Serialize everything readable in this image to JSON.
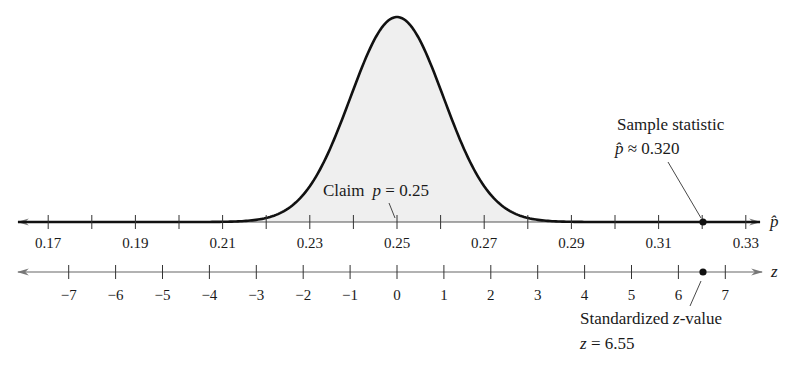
{
  "chart_data": {
    "type": "area",
    "title": "",
    "distribution": "normal",
    "claim": {
      "label": "Claim",
      "symbol": "p",
      "value": "0.25",
      "text": "Claim p = 0.25"
    },
    "sample_statistic": {
      "label": "Sample statistic",
      "symbol": "p̂",
      "relation": "≈",
      "value": "0.320",
      "x": 0.32
    },
    "standardized": {
      "label": "Standardized z-value",
      "symbol": "z",
      "relation": "=",
      "value": "6.55",
      "x": 6.55
    },
    "p_axis": {
      "label": "p̂",
      "ticks": [
        0.17,
        0.18,
        0.19,
        0.2,
        0.21,
        0.22,
        0.23,
        0.24,
        0.25,
        0.26,
        0.27,
        0.28,
        0.29,
        0.3,
        0.31,
        0.32,
        0.33
      ],
      "tick_labels": [
        "0.17",
        "0.19",
        "0.21",
        "0.23",
        "0.25",
        "0.27",
        "0.29",
        "0.31",
        "0.33"
      ],
      "range": [
        0.165,
        0.337
      ]
    },
    "z_axis": {
      "label": "z",
      "ticks": [
        -7,
        -6,
        -5,
        -4,
        -3,
        -2,
        -1,
        0,
        1,
        2,
        3,
        4,
        5,
        6,
        7
      ],
      "tick_labels": [
        "−7",
        "−6",
        "−5",
        "−4",
        "−3",
        "−2",
        "−1",
        "0",
        "1",
        "2",
        "3",
        "4",
        "5",
        "6",
        "7"
      ]
    },
    "mean": 0.25,
    "std_error": 0.0107,
    "shading_color": "#efefef",
    "curve_color": "#111111"
  },
  "labels": {
    "claim_word": "Claim",
    "claim_symbol": "p",
    "claim_rest": " = 0.25",
    "sample_title": "Sample statistic",
    "sample_symbol": "p̂",
    "sample_rest": " ≈ 0.320",
    "z_title_a": "Standardized ",
    "z_title_sym": "z",
    "z_title_b": "-value",
    "z_value_sym": "z",
    "z_value_rest": " = 6.55",
    "p_axis_label": "p̂",
    "z_axis_label": "z"
  }
}
